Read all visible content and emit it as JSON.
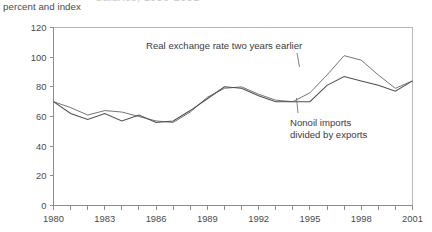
{
  "figure": {
    "clipped_title": "balance, 1980-2001",
    "subtitle": "percent and index"
  },
  "chart_data": {
    "type": "line",
    "title": "",
    "subtitle": "percent and index",
    "xlabel": "",
    "ylabel": "percent and index",
    "xlim": [
      1980,
      2001
    ],
    "ylim": [
      0,
      120
    ],
    "yticks": [
      0,
      20,
      40,
      60,
      80,
      100,
      120
    ],
    "ytick_labels": [
      "0",
      "20",
      "40",
      "60",
      "80",
      "100",
      "120"
    ],
    "xticks": [
      1980,
      1981,
      1982,
      1983,
      1984,
      1985,
      1986,
      1987,
      1988,
      1989,
      1990,
      1991,
      1992,
      1993,
      1994,
      1995,
      1996,
      1997,
      1998,
      1999,
      2000,
      2001
    ],
    "xtick_labels": [
      "1980",
      "",
      "",
      "1983",
      "",
      "",
      "1986",
      "",
      "",
      "1989",
      "",
      "",
      "1992",
      "",
      "",
      "1995",
      "",
      "",
      "1998",
      "",
      "",
      "2001"
    ],
    "grid": false,
    "legend_position": "inline-annotations",
    "x": [
      1980,
      1981,
      1982,
      1983,
      1984,
      1985,
      1986,
      1987,
      1988,
      1989,
      1990,
      1991,
      1992,
      1993,
      1994,
      1995,
      1996,
      1997,
      1998,
      1999,
      2000,
      2001
    ],
    "series": [
      {
        "name": "Real exchange rate two years earlier",
        "values": [
          70,
          66,
          61,
          64,
          63,
          60,
          57,
          56,
          63,
          73,
          79,
          80,
          75,
          71,
          70,
          76,
          88,
          101,
          98,
          88,
          79,
          84
        ]
      },
      {
        "name": "Nonoil imports divided by exports",
        "values": [
          70,
          62,
          58,
          62,
          57,
          61,
          56,
          57,
          64,
          72,
          80,
          79,
          74,
          70,
          70,
          70,
          81,
          87,
          84,
          81,
          77,
          84
        ]
      }
    ],
    "annotations": [
      {
        "text": "Real exchange rate two years earlier",
        "target_series": "Real exchange rate two years earlier",
        "target_x": 1995,
        "position": "above-left"
      },
      {
        "text": "Nonoil imports divided by exports",
        "text_line_1": "Nonoil imports",
        "text_line_2": "divided by exports",
        "target_series": "Nonoil imports divided by exports",
        "target_x": 1995,
        "position": "below-right"
      }
    ],
    "colors": {
      "series_1": "#6e6e6e",
      "series_2": "#4f4f4f",
      "axis": "#8d8d8d",
      "frame": "#b9b9b9",
      "text": "#3b3b3b"
    }
  }
}
